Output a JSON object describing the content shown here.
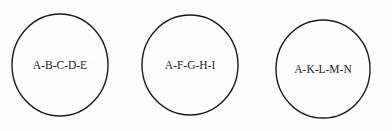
{
  "diagram": {
    "colors": {
      "background": "#fdfdfd",
      "stroke": "#1a1a1a",
      "text": "#1a1a1a"
    },
    "nodes": [
      {
        "label": "A-B-C-D-E",
        "shape": "circle",
        "cx": 60,
        "cy": 65,
        "rx": 48,
        "ry": 51
      },
      {
        "label": "A-F-G-H-I",
        "shape": "circle",
        "cx": 190,
        "cy": 65,
        "rx": 48,
        "ry": 50
      },
      {
        "label": "A-K-L-M-N",
        "shape": "circle",
        "cx": 323,
        "cy": 69,
        "rx": 47,
        "ry": 49
      }
    ]
  }
}
